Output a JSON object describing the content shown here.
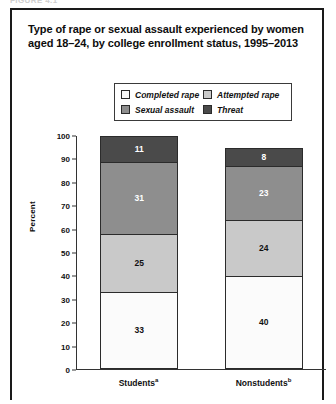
{
  "figure_caption": "FIGURE 4.1",
  "title": "Type of rape or sexual assault experienced by women aged 18–24, by college enrollment status, 1995–2013",
  "legend": {
    "items": [
      {
        "label": "Completed rape",
        "color": "#fbfbfb"
      },
      {
        "label": "Attempted rape",
        "color": "#c9c9c9"
      },
      {
        "label": "Sexual assault",
        "color": "#8e8e8e"
      },
      {
        "label": "Threat",
        "color": "#4a4a4a"
      }
    ]
  },
  "axes": {
    "ylabel": "Percent",
    "yticks": [
      "100",
      "90",
      "80",
      "70",
      "60",
      "50",
      "40",
      "30",
      "20",
      "10",
      "0"
    ],
    "xlabels": [
      {
        "text": "Students",
        "note": "a"
      },
      {
        "text": "Nonstudents",
        "note": "b"
      }
    ]
  },
  "chart_data": {
    "type": "bar",
    "title": "Type of rape or sexual assault experienced by women aged 18–24, by college enrollment status, 1995–2013",
    "xlabel": "",
    "ylabel": "Percent",
    "ylim": [
      0,
      100
    ],
    "ytick_step": 10,
    "grid": false,
    "stacked": true,
    "legend_position": "top",
    "categories": [
      "Students",
      "Nonstudents"
    ],
    "series": [
      {
        "name": "Completed rape",
        "color": "#fbfbfb",
        "text_color": "#111111",
        "values": [
          33,
          40
        ]
      },
      {
        "name": "Attempted rape",
        "color": "#c9c9c9",
        "text_color": "#111111",
        "values": [
          25,
          24
        ]
      },
      {
        "name": "Sexual assault",
        "color": "#8e8e8e",
        "text_color": "#ffffff",
        "values": [
          31,
          23
        ]
      },
      {
        "name": "Threat",
        "color": "#4a4a4a",
        "text_color": "#ffffff",
        "values": [
          11,
          8
        ]
      }
    ]
  }
}
